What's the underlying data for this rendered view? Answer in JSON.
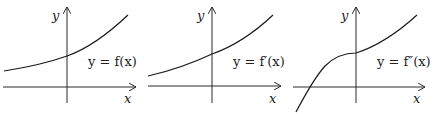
{
  "figure": {
    "panels": [
      {
        "id": "f",
        "y_axis_label": "y",
        "x_axis_label": "x",
        "equation_label": "y = f(x)",
        "description": "smooth increasing convex curve, positive everywhere"
      },
      {
        "id": "f-prime",
        "y_axis_label": "y",
        "x_axis_label": "x",
        "equation_label": "y = f′(x)",
        "description": "smooth increasing convex curve, positive everywhere"
      },
      {
        "id": "f-double-prime",
        "y_axis_label": "y",
        "x_axis_label": "x",
        "equation_label": "y = f″(x)",
        "description": "increasing curve crossing x-axis on the left, concave then corner at y-axis, then increasing"
      }
    ]
  }
}
